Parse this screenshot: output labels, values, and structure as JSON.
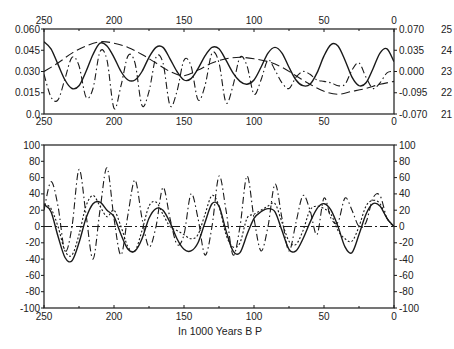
{
  "chart_data": [
    {
      "type": "line",
      "title": "",
      "xlabel": "",
      "x_ticks_top": [
        "250",
        "200",
        "150",
        "100",
        "50",
        "0"
      ],
      "x_ticks_bottom": [
        "250",
        "200",
        "150",
        "100",
        "50",
        "0"
      ],
      "xlim": [
        250,
        0
      ],
      "ylabel_left": "",
      "y_ticks_left": [
        "0.060",
        "0.045",
        "0.030",
        "0.015",
        "0.0"
      ],
      "ylim_left": [
        0.0,
        0.06
      ],
      "y_ticks_right_inner": [
        "0.070",
        "0.035",
        "0.000",
        "-0.095",
        "-0.070"
      ],
      "y_ticks_right_outer": [
        "25",
        "24",
        "23",
        "22",
        "21"
      ],
      "grid": false,
      "series": [
        {
          "name": "solid",
          "style": "solid",
          "x": [
            250,
            245,
            240,
            235,
            230,
            225,
            220,
            215,
            210,
            205,
            200,
            195,
            190,
            185,
            180,
            175,
            170,
            165,
            160,
            155,
            150,
            145,
            140,
            135,
            130,
            125,
            120,
            115,
            110,
            105,
            100,
            95,
            90,
            85,
            80,
            75,
            70,
            65,
            60,
            55,
            50,
            45,
            40,
            35,
            30,
            25,
            20,
            15,
            10,
            5,
            0
          ],
          "values": [
            0.051,
            0.046,
            0.035,
            0.024,
            0.018,
            0.02,
            0.03,
            0.042,
            0.05,
            0.048,
            0.04,
            0.03,
            0.024,
            0.024,
            0.03,
            0.04,
            0.047,
            0.047,
            0.039,
            0.03,
            0.024,
            0.025,
            0.032,
            0.041,
            0.047,
            0.046,
            0.038,
            0.029,
            0.023,
            0.021,
            0.024,
            0.033,
            0.043,
            0.047,
            0.043,
            0.033,
            0.024,
            0.02,
            0.021,
            0.029,
            0.041,
            0.049,
            0.048,
            0.038,
            0.026,
            0.02,
            0.022,
            0.032,
            0.043,
            0.046,
            0.037
          ]
        },
        {
          "name": "dashed",
          "style": "dashed",
          "x": [
            250,
            240,
            230,
            220,
            210,
            200,
            190,
            180,
            170,
            160,
            150,
            140,
            130,
            120,
            110,
            100,
            90,
            80,
            70,
            60,
            50,
            40,
            30,
            20,
            10,
            0
          ],
          "values": [
            0.03,
            0.036,
            0.043,
            0.048,
            0.051,
            0.05,
            0.047,
            0.042,
            0.036,
            0.03,
            0.027,
            0.031,
            0.036,
            0.039,
            0.04,
            0.039,
            0.037,
            0.033,
            0.027,
            0.021,
            0.016,
            0.014,
            0.016,
            0.018,
            0.021,
            0.023
          ]
        },
        {
          "name": "dash-dot",
          "style": "dash-dot",
          "x": [
            250,
            245,
            240,
            235,
            230,
            225,
            220,
            215,
            210,
            205,
            200,
            195,
            190,
            185,
            180,
            175,
            170,
            165,
            160,
            155,
            150,
            145,
            140,
            135,
            130,
            125,
            120,
            115,
            110,
            105,
            100,
            95,
            90,
            85,
            80,
            75,
            70,
            65,
            60,
            55,
            50,
            45,
            40,
            35,
            30,
            25,
            20,
            15,
            10,
            5,
            0
          ],
          "values": [
            0.028,
            0.012,
            0.01,
            0.025,
            0.04,
            0.034,
            0.012,
            0.018,
            0.044,
            0.038,
            0.004,
            0.02,
            0.041,
            0.036,
            0.006,
            0.016,
            0.04,
            0.036,
            0.006,
            0.016,
            0.038,
            0.034,
            0.01,
            0.02,
            0.043,
            0.036,
            0.008,
            0.02,
            0.04,
            0.034,
            0.014,
            0.024,
            0.038,
            0.031,
            0.022,
            0.018,
            0.026,
            0.03,
            0.028,
            0.024,
            0.023,
            0.022,
            0.02,
            0.021,
            0.031,
            0.036,
            0.026,
            0.018,
            0.022,
            0.029,
            0.03
          ]
        }
      ]
    },
    {
      "type": "line",
      "title": "",
      "xlabel": "In 1000 Years B P",
      "x_ticks_bottom": [
        "250",
        "200",
        "150",
        "100",
        "50",
        "0"
      ],
      "xlim": [
        250,
        0
      ],
      "y_ticks_left": [
        "100",
        "80",
        "60",
        "40",
        "20",
        "0",
        "-20",
        "-40",
        "-60",
        "-80",
        "-100"
      ],
      "y_ticks_right": [
        "100",
        "80",
        "60",
        "40",
        "20",
        "0",
        "-20",
        "-40",
        "-60",
        "-80",
        "-100"
      ],
      "ylim": [
        -100,
        100
      ],
      "grid": false,
      "series": [
        {
          "name": "solid",
          "style": "solid",
          "x": [
            250,
            245,
            240,
            235,
            230,
            225,
            220,
            215,
            210,
            205,
            200,
            195,
            190,
            185,
            180,
            175,
            170,
            165,
            160,
            155,
            150,
            145,
            140,
            135,
            130,
            125,
            120,
            115,
            110,
            105,
            100,
            95,
            90,
            85,
            80,
            75,
            70,
            65,
            60,
            55,
            50,
            45,
            40,
            35,
            30,
            25,
            20,
            15,
            10,
            5,
            0
          ],
          "values": [
            27,
            18,
            -12,
            -38,
            -42,
            -20,
            10,
            28,
            30,
            20,
            12,
            -10,
            -28,
            -30,
            -15,
            10,
            22,
            20,
            5,
            -15,
            -28,
            -30,
            -20,
            5,
            28,
            25,
            -5,
            -30,
            -32,
            -10,
            10,
            18,
            22,
            18,
            -5,
            -28,
            -30,
            -15,
            5,
            22,
            28,
            20,
            0,
            -25,
            -32,
            -10,
            15,
            28,
            25,
            10,
            0
          ]
        },
        {
          "name": "dotted",
          "style": "dotted",
          "x": [
            250,
            245,
            240,
            235,
            230,
            225,
            220,
            215,
            210,
            205,
            200,
            195,
            190,
            185,
            180,
            175,
            170,
            165,
            160,
            155,
            150,
            145,
            140,
            135,
            130,
            125,
            120,
            115,
            110,
            105,
            100,
            95,
            90,
            85,
            80,
            75,
            70,
            65,
            60,
            55,
            50,
            45,
            40,
            35,
            30,
            25,
            20,
            15,
            10,
            5,
            0
          ],
          "values": [
            28,
            22,
            0,
            -30,
            -35,
            -10,
            25,
            38,
            25,
            12,
            20,
            0,
            -25,
            -30,
            -5,
            25,
            30,
            15,
            0,
            -5,
            -10,
            -15,
            -10,
            15,
            38,
            25,
            -10,
            -25,
            -20,
            10,
            15,
            20,
            25,
            28,
            5,
            -18,
            -22,
            -5,
            20,
            25,
            22,
            15,
            -5,
            -15,
            -18,
            0,
            25,
            32,
            28,
            10,
            0
          ]
        },
        {
          "name": "dash-dot",
          "style": "dash-dot",
          "x": [
            250,
            245,
            240,
            235,
            230,
            225,
            220,
            215,
            210,
            205,
            200,
            195,
            190,
            185,
            180,
            175,
            170,
            165,
            160,
            155,
            150,
            145,
            140,
            135,
            130,
            125,
            120,
            115,
            110,
            105,
            100,
            95,
            90,
            85,
            80,
            75,
            70,
            65,
            60,
            55,
            50,
            45,
            40,
            35,
            30,
            25,
            20,
            15,
            10,
            5,
            0
          ],
          "values": [
            20,
            55,
            25,
            -30,
            0,
            70,
            15,
            -40,
            20,
            72,
            10,
            -35,
            15,
            57,
            10,
            -25,
            0,
            48,
            10,
            -22,
            -10,
            40,
            10,
            -35,
            0,
            62,
            20,
            -35,
            0,
            62,
            10,
            -30,
            0,
            52,
            10,
            -30,
            5,
            38,
            20,
            -10,
            35,
            10,
            5,
            35,
            20,
            0,
            5,
            35,
            38,
            10,
            0
          ]
        },
        {
          "name": "baseline",
          "style": "dash-dot-flat",
          "x": [
            250,
            0
          ],
          "values": [
            0,
            0
          ]
        }
      ]
    }
  ],
  "labels": {
    "xlabel": "In 1000 Years B P"
  }
}
